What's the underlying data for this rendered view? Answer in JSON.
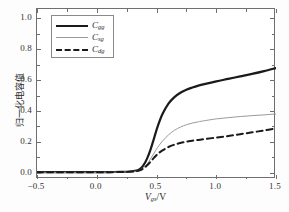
{
  "chart_data": {
    "type": "line",
    "title": "",
    "xlabel": "V_gs / V",
    "ylabel": "归一化电容值",
    "xlim": [
      -0.5,
      1.5
    ],
    "ylim": [
      -0.04,
      1.06
    ],
    "xticks": [
      "-0.5",
      "0.0",
      "0.5",
      "1.0",
      "1.5"
    ],
    "xtick_values": [
      -0.5,
      0.0,
      0.5,
      1.0,
      1.5
    ],
    "yticks": [
      "0.0",
      "0.2",
      "0.4",
      "0.6",
      "0.8",
      "1.0"
    ],
    "ytick_values": [
      0.0,
      0.2,
      0.4,
      0.6,
      0.8,
      1.0
    ],
    "grid": false,
    "legend_position": "upper-left",
    "x": [
      -0.5,
      -0.4,
      -0.3,
      -0.2,
      -0.1,
      0.0,
      0.1,
      0.2,
      0.25,
      0.3,
      0.33,
      0.36,
      0.39,
      0.42,
      0.45,
      0.48,
      0.51,
      0.55,
      0.6,
      0.65,
      0.7,
      0.75,
      0.8,
      0.85,
      0.9,
      1.0,
      1.1,
      1.2,
      1.3,
      1.4,
      1.5
    ],
    "series": [
      {
        "name": "C_gg",
        "label": "C",
        "subscript": "gg",
        "style": "solid",
        "color": "#1a1a1a",
        "width": 2.2,
        "values": [
          0.004,
          0.004,
          0.004,
          0.004,
          0.004,
          0.004,
          0.005,
          0.006,
          0.007,
          0.01,
          0.014,
          0.024,
          0.048,
          0.09,
          0.15,
          0.225,
          0.3,
          0.38,
          0.448,
          0.49,
          0.518,
          0.538,
          0.552,
          0.564,
          0.574,
          0.592,
          0.608,
          0.624,
          0.64,
          0.658,
          0.678
        ]
      },
      {
        "name": "C_sg",
        "label": "C",
        "subscript": "sg",
        "style": "solid-thin",
        "color": "#9b9b9b",
        "width": 1.0,
        "values": [
          0.003,
          0.003,
          0.003,
          0.003,
          0.003,
          0.003,
          0.004,
          0.005,
          0.006,
          0.008,
          0.011,
          0.018,
          0.032,
          0.056,
          0.09,
          0.128,
          0.165,
          0.205,
          0.245,
          0.275,
          0.296,
          0.311,
          0.322,
          0.33,
          0.337,
          0.349,
          0.357,
          0.364,
          0.37,
          0.375,
          0.381
        ]
      },
      {
        "name": "C_dg",
        "label": "C",
        "subscript": "dg",
        "style": "dashed",
        "color": "#1a1a1a",
        "width": 2.0,
        "values": [
          0.003,
          0.003,
          0.003,
          0.003,
          0.003,
          0.003,
          0.004,
          0.005,
          0.006,
          0.008,
          0.01,
          0.016,
          0.028,
          0.047,
          0.072,
          0.098,
          0.122,
          0.145,
          0.167,
          0.182,
          0.193,
          0.201,
          0.208,
          0.213,
          0.218,
          0.228,
          0.238,
          0.25,
          0.262,
          0.274,
          0.288
        ]
      }
    ]
  },
  "axes": {
    "x_title_var": "V",
    "x_title_sub": "gs",
    "x_title_unit": "/V",
    "y_title": "归一化电容值"
  },
  "legend": {
    "entries": [
      {
        "label": "C",
        "sub": "gg"
      },
      {
        "label": "C",
        "sub": "sg"
      },
      {
        "label": "C",
        "sub": "dg"
      }
    ]
  },
  "colors": {
    "curve_primary": "#1a1a1a",
    "curve_secondary": "#9b9b9b",
    "frame": "#6f6f6f",
    "background": "#ffffff"
  }
}
